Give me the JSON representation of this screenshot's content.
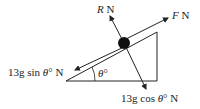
{
  "diagram": {
    "type": "force diagram on inclined plane",
    "labels": {
      "reaction": {
        "var": "R",
        "unit": " N"
      },
      "force": {
        "var": "F",
        "unit": " N"
      },
      "sin_component": {
        "pre": "13g sin ",
        "var": "θ",
        "post": "° N"
      },
      "cos_component": {
        "pre": "13g cos ",
        "var": "θ",
        "post": "° N"
      },
      "angle": {
        "var": "θ",
        "post": "°"
      }
    },
    "colors": {
      "line": "#222222",
      "ball": "#111111",
      "background": "#ffffff"
    }
  }
}
